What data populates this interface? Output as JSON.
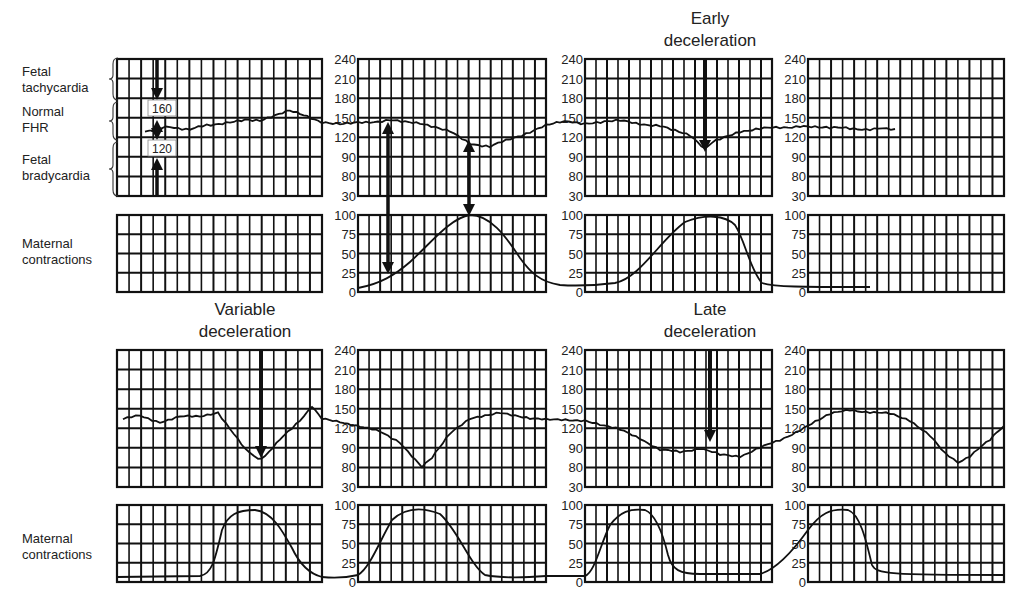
{
  "figure": {
    "side_labels": {
      "fetal_tachycardia": [
        "Fetal",
        "tachycardia"
      ],
      "normal_fhr": [
        "Normal",
        "FHR"
      ],
      "fetal_bradycardia": [
        "Fetal",
        "bradycardia"
      ],
      "maternal_contractions_top": [
        "Maternal",
        "contractions"
      ],
      "maternal_contractions_bottom": [
        "Maternal",
        "contractions"
      ]
    },
    "titles": {
      "early": [
        "Early",
        "deceleration"
      ],
      "variable": [
        "Variable",
        "deceleration"
      ],
      "late": [
        "Late",
        "deceleration"
      ]
    },
    "baseline_markers": {
      "upper": "160",
      "lower": "120"
    }
  },
  "chart_data": [
    {
      "type": "line",
      "title": "Fetal heart rate (top row) - normal baseline / early deceleration",
      "ylabel": "FHR (bpm)",
      "yticks": [
        "240",
        "210",
        "180",
        "150",
        "120",
        "90",
        "80",
        "30"
      ],
      "ylim": [
        30,
        240
      ],
      "grid": true,
      "annotations": [
        "Fetal tachycardia",
        "Normal FHR (120-160)",
        "Fetal bradycardia",
        "Early deceleration"
      ],
      "series": [
        {
          "name": "FHR",
          "points": [
            [
              0,
              140
            ],
            [
              10,
              138
            ],
            [
              20,
              142
            ],
            [
              30,
              150
            ],
            [
              35,
              158
            ],
            [
              40,
              145
            ],
            [
              45,
              148
            ],
            [
              55,
              145
            ],
            [
              60,
              140
            ],
            [
              65,
              120
            ],
            [
              70,
              125
            ],
            [
              80,
              140
            ],
            [
              90,
              140
            ],
            [
              100,
              138
            ],
            [
              110,
              130
            ],
            [
              115,
              100
            ],
            [
              120,
              130
            ],
            [
              130,
              140
            ],
            [
              140,
              138
            ],
            [
              150,
              135
            ]
          ]
        }
      ]
    },
    {
      "type": "line",
      "title": "Maternal contractions (top row)",
      "ylabel": "Pressure",
      "yticks": [
        "100",
        "75",
        "50",
        "25",
        "0"
      ],
      "ylim": [
        0,
        100
      ],
      "grid": true,
      "series": [
        {
          "name": "Contraction",
          "points": [
            [
              0,
              5
            ],
            [
              40,
              5
            ],
            [
              45,
              10
            ],
            [
              55,
              60
            ],
            [
              63,
              98
            ],
            [
              70,
              70
            ],
            [
              78,
              15
            ],
            [
              85,
              5
            ],
            [
              95,
              5
            ],
            [
              105,
              50
            ],
            [
              112,
              90
            ],
            [
              118,
              90
            ],
            [
              124,
              25
            ],
            [
              130,
              5
            ],
            [
              140,
              5
            ]
          ]
        }
      ]
    },
    {
      "type": "line",
      "title": "Fetal heart rate (bottom row) - variable / late deceleration",
      "ylabel": "FHR (bpm)",
      "yticks": [
        "240",
        "210",
        "180",
        "150",
        "120",
        "90",
        "80",
        "30"
      ],
      "ylim": [
        30,
        240
      ],
      "grid": true,
      "annotations": [
        "Variable deceleration",
        "Late deceleration"
      ],
      "series": [
        {
          "name": "FHR",
          "points": [
            [
              0,
              130
            ],
            [
              15,
              132
            ],
            [
              20,
              85
            ],
            [
              27,
              150
            ],
            [
              30,
              125
            ],
            [
              40,
              110
            ],
            [
              45,
              70
            ],
            [
              55,
              130
            ],
            [
              65,
              122
            ],
            [
              72,
              118
            ],
            [
              80,
              95
            ],
            [
              88,
              90
            ],
            [
              95,
              95
            ],
            [
              105,
              140
            ],
            [
              115,
              135
            ],
            [
              125,
              80
            ],
            [
              135,
              120
            ]
          ]
        }
      ]
    },
    {
      "type": "line",
      "title": "Maternal contractions (bottom row)",
      "ylabel": "Pressure",
      "yticks": [
        "100",
        "75",
        "50",
        "25",
        "0"
      ],
      "ylim": [
        0,
        100
      ],
      "grid": true,
      "series": [
        {
          "name": "Contraction",
          "points": [
            [
              0,
              5
            ],
            [
              15,
              5
            ],
            [
              20,
              85
            ],
            [
              27,
              85
            ],
            [
              32,
              10
            ],
            [
              38,
              5
            ],
            [
              45,
              90
            ],
            [
              52,
              90
            ],
            [
              58,
              10
            ],
            [
              62,
              5
            ],
            [
              66,
              88
            ],
            [
              71,
              88
            ],
            [
              75,
              10
            ],
            [
              82,
              5
            ],
            [
              90,
              95
            ],
            [
              96,
              95
            ],
            [
              100,
              10
            ],
            [
              140,
              10
            ]
          ]
        }
      ]
    }
  ]
}
